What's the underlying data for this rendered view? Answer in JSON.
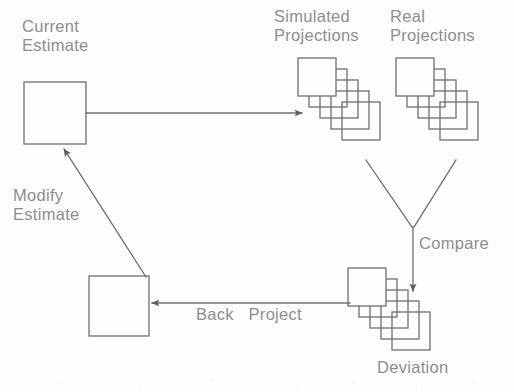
{
  "diagram": {
    "canvas": {
      "width": 514,
      "height": 392,
      "background": "#fdfdfd"
    },
    "style": {
      "stroke_color": "#6f6f72",
      "stroke_width": 1.3,
      "text_color": "#8d8d8f",
      "font_size_px": 16.5
    },
    "labels": {
      "current_estimate": "Current\nEstimate",
      "simulated_projections": "Simulated\nProjections",
      "real_projections": "Real\nProjections",
      "modify_estimate": "Modify\nEstimate",
      "compare": "Compare",
      "back_project": "Back   Project",
      "deviation": "Deviation"
    },
    "nodes": [
      {
        "id": "current-estimate-box",
        "type": "box",
        "label": "Current Estimate",
        "x": 24,
        "y": 82,
        "width": 62,
        "height": 62
      },
      {
        "id": "simulated-projections-stack",
        "type": "stack",
        "label": "Simulated Projections",
        "x": 298,
        "y": 58,
        "square_size": 38,
        "count": 5,
        "offset_x": 11,
        "offset_y": 11
      },
      {
        "id": "real-projections-stack",
        "type": "stack",
        "label": "Real Projections",
        "x": 396,
        "y": 58,
        "square_size": 38,
        "count": 5,
        "offset_x": 11,
        "offset_y": 11
      },
      {
        "id": "deviation-stack",
        "type": "stack",
        "label": "Deviation",
        "x": 348,
        "y": 268,
        "square_size": 38,
        "count": 5,
        "offset_x": 11,
        "offset_y": 11
      },
      {
        "id": "back-project-box",
        "type": "box",
        "label": "Back Project",
        "x": 89,
        "y": 276,
        "width": 60,
        "height": 60
      }
    ],
    "edges": [
      {
        "id": "edge-estimate-to-simulated",
        "from": "current-estimate-box",
        "to": "simulated-projections-stack",
        "label": "",
        "arrowhead": true,
        "points": "86,113 303,113"
      },
      {
        "id": "edge-simulated-to-compare",
        "from": "simulated-projections-stack",
        "to": "compare-junction",
        "label": "",
        "arrowhead": false,
        "points": "366,160 413,228"
      },
      {
        "id": "edge-real-to-compare",
        "from": "real-projections-stack",
        "to": "compare-junction",
        "label": "",
        "arrowhead": false,
        "points": "455,160 413,228"
      },
      {
        "id": "edge-compare-to-deviation",
        "from": "compare-junction",
        "to": "deviation-stack",
        "label": "Compare",
        "arrowhead": true,
        "points": "413,228 413,292"
      },
      {
        "id": "edge-deviation-to-backproject",
        "from": "deviation-stack",
        "to": "back-project-box",
        "label": "Back   Project",
        "arrowhead": true,
        "points": "348,303 151,303"
      },
      {
        "id": "edge-backproject-to-estimate",
        "from": "back-project-box",
        "to": "current-estimate-box",
        "label": "Modify Estimate",
        "arrowhead": true,
        "points": "146,277 63,148"
      }
    ]
  }
}
